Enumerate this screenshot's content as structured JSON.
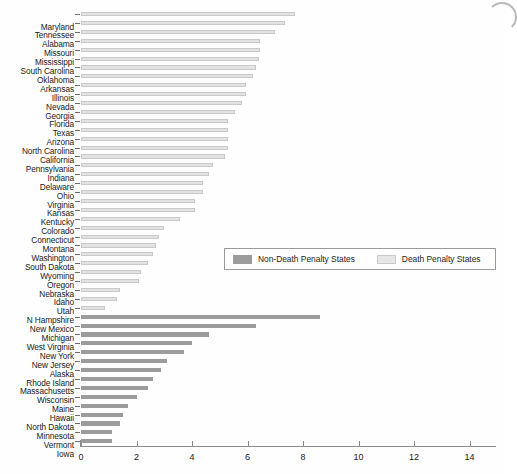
{
  "chart_data": {
    "type": "bar",
    "orientation": "horizontal",
    "title": "",
    "subtitle": "",
    "xlabel": "",
    "ylabel": "",
    "xlim": [
      0,
      14.8
    ],
    "xticks": [
      0,
      2,
      4,
      6,
      8,
      10,
      12,
      14
    ],
    "xtick_labels": [
      "0",
      "2",
      "4",
      "6",
      "8",
      "10",
      "12",
      "14"
    ],
    "grid": false,
    "legend_position": "center-right",
    "legend": [
      {
        "label": "Non-Death Penalty States",
        "color": "#9c9c9c"
      },
      {
        "label": "Death Penalty States",
        "color": "#e6e6e6"
      }
    ],
    "series": [
      {
        "name": "Death Penalty States",
        "color": "#e6e6e6",
        "categories": [
          "Maryland",
          "Tennessee",
          "Alabama",
          "Missouri",
          "Mississippi",
          "South Carolina",
          "Oklahoma",
          "Arkansas",
          "Illinois",
          "Nevada",
          "Georgia",
          "Florida",
          "Texas",
          "Arizona",
          "North Carolina",
          "California",
          "Pennsylvania",
          "Indiana",
          "Delaware",
          "Ohio",
          "Virginia",
          "Kansas",
          "Kentucky",
          "Colorado",
          "Connecticut",
          "Montana",
          "Washington",
          "South Dakota",
          "Wyoming",
          "Oregon",
          "Nebraska",
          "Idaho",
          "Utah",
          "N Hampshire"
        ],
        "values": [
          7.7,
          7.35,
          7.0,
          6.45,
          6.45,
          6.4,
          6.3,
          6.2,
          5.95,
          5.95,
          5.8,
          5.55,
          5.3,
          5.3,
          5.3,
          5.3,
          5.2,
          4.75,
          4.6,
          4.4,
          4.4,
          4.1,
          4.1,
          3.55,
          3.0,
          2.8,
          2.7,
          2.6,
          2.4,
          2.15,
          2.1,
          1.4,
          1.3,
          0.85
        ]
      },
      {
        "name": "Non-Death Penalty States",
        "color": "#9c9c9c",
        "categories": [
          "New Mexico",
          "Michigan",
          "West Virginia",
          "New York",
          "New Jersey",
          "Alaska",
          "Rhode Island",
          "Massachusetts",
          "Wisconsin",
          "Maine",
          "Hawaii",
          "North Dakota",
          "Minnesota",
          "Vermont",
          "Iowa"
        ],
        "values": [
          8.6,
          6.3,
          4.6,
          4.0,
          3.7,
          3.1,
          2.9,
          2.6,
          2.4,
          2.0,
          1.7,
          1.5,
          1.4,
          1.1,
          1.1
        ]
      }
    ]
  }
}
